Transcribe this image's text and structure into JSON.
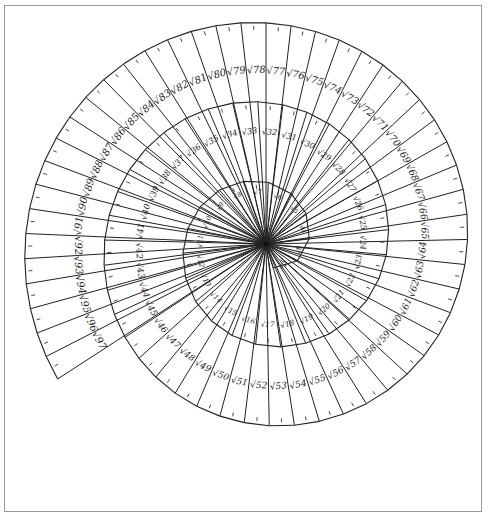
{
  "diagram": {
    "title": "",
    "type": "spiral-of-theodorus",
    "center": [
      266,
      244
    ],
    "scale_px_per_unit": 25.2,
    "start_angle_deg": -28,
    "direction": "counterclockwise",
    "unit_label": "1",
    "labels": [
      "√2",
      "√3",
      "√4",
      "√5",
      "√6",
      "√7",
      "√8",
      "√9",
      "√10",
      "√11",
      "√12",
      "√13",
      "√14",
      "√15",
      "√16",
      "√17",
      "√18",
      "√19",
      "√20",
      "√21",
      "√22",
      "√23",
      "√24",
      "√25",
      "√26",
      "√27",
      "√28",
      "√29",
      "√30",
      "√31",
      "√32",
      "√33",
      "√34",
      "√35",
      "√36",
      "√37",
      "√38",
      "√39",
      "√40",
      "√41",
      "√42",
      "√43",
      "√44",
      "√45",
      "√46",
      "√47",
      "√48",
      "√49",
      "√50",
      "√51",
      "√52",
      "√53",
      "√54",
      "√55",
      "√56",
      "√57",
      "√58",
      "√59",
      "√60",
      "√61",
      "√62",
      "√63",
      "√64",
      "√65",
      "√66",
      "√67",
      "√68",
      "√69",
      "√70",
      "√71",
      "√72",
      "√73",
      "√74",
      "√75",
      "√76",
      "√77",
      "√78",
      "√79",
      "√80",
      "√81",
      "√82",
      "√83",
      "√84",
      "√85",
      "√86",
      "√87",
      "√88",
      "√89",
      "√90",
      "√91",
      "√92",
      "√93",
      "√94",
      "√95",
      "√96",
      "√97"
    ],
    "first_n": 2,
    "last_n": 97,
    "colors": {
      "ink": "#1a1a1a",
      "paper": "#ffffff",
      "frame": "#9a9a9a"
    }
  }
}
